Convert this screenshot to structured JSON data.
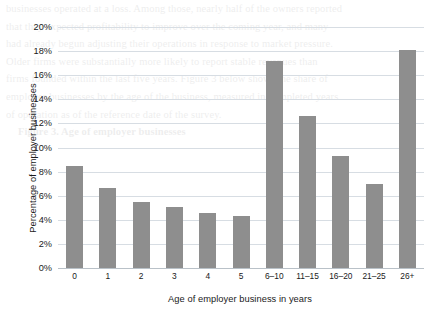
{
  "chart_data": {
    "type": "bar",
    "title": "",
    "xlabel": "Age of employer business in years",
    "ylabel": "Percentage of employer businesses",
    "categories": [
      "0",
      "1",
      "2",
      "3",
      "4",
      "5",
      "6–10",
      "11–15",
      "16–20",
      "21–25",
      "26+"
    ],
    "values": [
      8.5,
      6.6,
      5.5,
      5.1,
      4.6,
      4.3,
      17.2,
      12.6,
      9.3,
      7.0,
      18.1
    ],
    "ylim": [
      0,
      20
    ],
    "ytick_labels": [
      "0%",
      "2%",
      "4%",
      "6%",
      "8%",
      "10%",
      "12%",
      "14%",
      "16%",
      "18%",
      "20%"
    ],
    "ytick_values": [
      0,
      2,
      4,
      6,
      8,
      10,
      12,
      14,
      16,
      18,
      20
    ],
    "grid": true,
    "legend": false,
    "bar_color": "#8e8e8e",
    "grid_color": "#d7dde3",
    "text_color": "#1a1a1a"
  },
  "background_text": {
    "lines": [
      "businesses operated at a loss. Among those, nearly half of the owners reported",
      "that they expected profitability to improve over the coming year, and many",
      "had already begun adjusting their operations in response to market pressure.",
      "",
      "Older firms were substantially more likely to report stable revenues than",
      "firms founded within the last five years. Figure 3 below shows the share of",
      "employer businesses by the age of the business, measured in completed years",
      "of operation as of the reference date of the survey.",
      "",
      "",
      "",
      "",
      "",
      "",
      "",
      "",
      "",
      "",
      "",
      "",
      "",
      "",
      "",
      "Figure 3. Age of employer businesses"
    ]
  }
}
